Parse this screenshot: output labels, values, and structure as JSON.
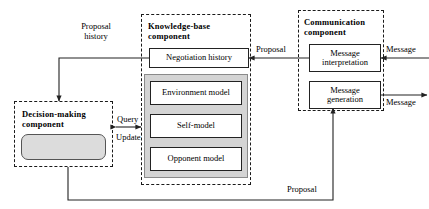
{
  "diagram": {
    "type": "block-diagram",
    "background": "#ffffff",
    "line_color": "#222222",
    "gray_panel_color": "#d4d4d4",
    "rounded_box_color": "#dcdcdc"
  },
  "components": {
    "decision_making": {
      "title_line1": "Decision-making",
      "title_line2": "component",
      "inner_box_label": ""
    },
    "knowledge_base": {
      "title_line1": "Knowledge-base",
      "title_line2": "component",
      "negotiation_history": "Negotiation history",
      "models": [
        "Environment model",
        "Self-model",
        "Opponent model"
      ]
    },
    "communication": {
      "title_line1": "Communication",
      "title_line2": "component",
      "message_interpretation_line1": "Message",
      "message_interpretation_line2": "interpretation",
      "message_generation_line1": "Message",
      "message_generation_line2": "generation"
    }
  },
  "connectors": {
    "proposal_history_line1": "Proposal",
    "proposal_history_line2": "history",
    "query": "Query",
    "update": "Update",
    "proposal_top": "Proposal",
    "proposal_bottom": "Proposal",
    "message_in": "Message",
    "message_out": "Message"
  }
}
